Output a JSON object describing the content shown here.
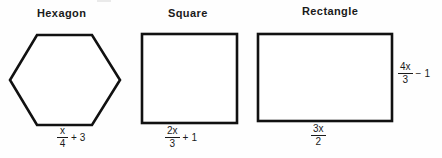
{
  "figure": {
    "background_color": "#fefefe",
    "ink_color": "#1a1a1a",
    "shapes": [
      {
        "name": "hexagon",
        "title": "Hexagon",
        "title_x": 37,
        "title_y": 7,
        "outline": "flat-top regular hexagon",
        "bounds": {
          "x": 10,
          "y": 34,
          "width": 110,
          "height": 90
        },
        "stroke_width": 2,
        "side_label": {
          "position": "bottom",
          "numerator": "x",
          "denominator": "4",
          "operator": "+",
          "constant": "3",
          "text": "x/4 + 3",
          "x": 57,
          "y": 128
        }
      },
      {
        "name": "square",
        "title": "Square",
        "title_x": 168,
        "title_y": 7,
        "outline": "square",
        "bounds": {
          "x": 142,
          "y": 34,
          "width": 96,
          "height": 90
        },
        "stroke_width": 2,
        "side_label": {
          "position": "bottom",
          "numerator": "2x",
          "denominator": "3",
          "operator": "+",
          "constant": "1",
          "text": "2x/3 + 1",
          "x": 165,
          "y": 128
        }
      },
      {
        "name": "rectangle",
        "title": "Rectangle",
        "title_x": 302,
        "title_y": 5,
        "outline": "rectangle",
        "bounds": {
          "x": 258,
          "y": 34,
          "width": 135,
          "height": 88
        },
        "stroke_width": 2,
        "side_label": {
          "position": "bottom",
          "numerator": "3x",
          "denominator": "2",
          "operator": "",
          "constant": "",
          "text": "3x/2",
          "x": 311,
          "y": 126
        },
        "height_label": {
          "position": "right",
          "numerator": "4x",
          "denominator": "3",
          "operator": "−",
          "constant": "1",
          "text": "4x/3 - 1",
          "x": 398,
          "y": 62
        }
      }
    ]
  }
}
